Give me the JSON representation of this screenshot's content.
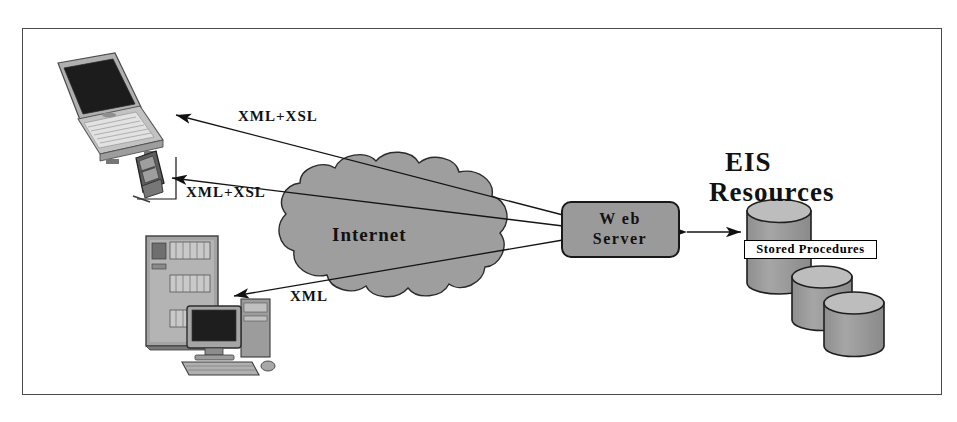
{
  "diagram": {
    "frame_border_color": "#4a4a4a",
    "background": "#ffffff",
    "fill_gray": "#9a9a9a",
    "line_color": "#1a1a1a"
  },
  "labels": {
    "xml_xsl_top": "XML+XSL",
    "xml_xsl_mid": "XML+XSL",
    "xml_bottom": "XML",
    "internet": "Internet",
    "web_server_line1": "W eb",
    "web_server_line2": "Server",
    "eis_line1": "EIS",
    "eis_line2": "Resources",
    "stored_procedures": "Stored Procedures"
  },
  "nodes": {
    "laptop": "laptop-client",
    "pda": "pda-client",
    "server_rack": "server-rack",
    "desktop_pc": "desktop-pc-client",
    "cloud": "internet-cloud",
    "web_server": "web-server-box",
    "databases": [
      "database-cylinder-1",
      "database-cylinder-2",
      "database-cylinder-3"
    ]
  },
  "connections": [
    {
      "from": "web-server-box",
      "to": "laptop-client",
      "label": "XML+XSL",
      "arrow": "single"
    },
    {
      "from": "web-server-box",
      "to": "pda-client",
      "label": "XML+XSL",
      "arrow": "single"
    },
    {
      "from": "web-server-box",
      "to": "desktop-pc-client",
      "label": "XML",
      "arrow": "single"
    },
    {
      "from": "web-server-box",
      "to": "database-cylinder-1",
      "label": "",
      "arrow": "double"
    }
  ],
  "colors": {
    "cloud_fill": "#9e9e9e",
    "cylinder_body": "#9a9a9a",
    "cylinder_top": "#b5b5b5",
    "web_server_fill": "#9a9a9a",
    "device_gray": "#8f8f8f",
    "screen_dark": "#1c1c1c"
  }
}
